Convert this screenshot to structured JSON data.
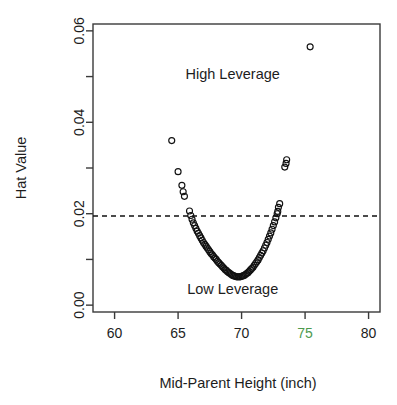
{
  "chart_data": {
    "type": "scatter",
    "title": "",
    "xlabel": "Mid-Parent Height (inch)",
    "ylabel": "Hat Value",
    "xlim": [
      58.3,
      80.9
    ],
    "ylim": [
      -0.0015,
      0.0615
    ],
    "grid": false,
    "legend": null,
    "xticks": [
      60,
      65,
      70,
      75,
      80
    ],
    "xtick_labels": [
      "60",
      "65",
      "70",
      "75",
      "80"
    ],
    "xtick_label_colors": [
      "#1d1d1d",
      "#1d1d1d",
      "#1d1d1d",
      "#4e9a4e",
      "#1d1d1d"
    ],
    "yticks": [
      0.0,
      0.01,
      0.02,
      0.03,
      0.04,
      0.05,
      0.06
    ],
    "ytick_labels": [
      "0.00",
      "",
      "0.02",
      "",
      "0.04",
      "",
      "0.06"
    ],
    "annotations": [
      {
        "text": "High Leverage",
        "x": 69.3,
        "y": 0.0495
      },
      {
        "text": "Low Leverage",
        "x": 69.3,
        "y": 0.0025
      }
    ],
    "threshold": {
      "label": "hat value cutoff",
      "y": 0.0195,
      "style": "dashed",
      "color": "#111111"
    },
    "marker": {
      "shape": "open-circle",
      "radius_px": 3.0,
      "color": "#111111"
    },
    "points": [
      [
        64.5,
        0.036
      ],
      [
        65.0,
        0.0292
      ],
      [
        65.3,
        0.0262
      ],
      [
        65.4,
        0.0248
      ],
      [
        65.5,
        0.0238
      ],
      [
        65.9,
        0.0206
      ],
      [
        66.0,
        0.0196
      ],
      [
        66.1,
        0.0188
      ],
      [
        66.2,
        0.018
      ],
      [
        66.3,
        0.0174
      ],
      [
        66.4,
        0.0168
      ],
      [
        66.5,
        0.0162
      ],
      [
        66.6,
        0.0157
      ],
      [
        66.7,
        0.0152
      ],
      [
        66.8,
        0.0147
      ],
      [
        66.9,
        0.0142
      ],
      [
        67.0,
        0.0137
      ],
      [
        67.1,
        0.0133
      ],
      [
        67.2,
        0.0129
      ],
      [
        67.3,
        0.0125
      ],
      [
        67.4,
        0.0121
      ],
      [
        67.5,
        0.0117
      ],
      [
        67.6,
        0.0113
      ],
      [
        67.7,
        0.011
      ],
      [
        67.8,
        0.0106
      ],
      [
        67.9,
        0.0103
      ],
      [
        68.0,
        0.01
      ],
      [
        68.1,
        0.0096
      ],
      [
        68.2,
        0.0093
      ],
      [
        68.3,
        0.009
      ],
      [
        68.4,
        0.0087
      ],
      [
        68.5,
        0.0084
      ],
      [
        68.6,
        0.0081
      ],
      [
        68.7,
        0.0078
      ],
      [
        68.8,
        0.0076
      ],
      [
        68.9,
        0.0073
      ],
      [
        69.0,
        0.0071
      ],
      [
        69.1,
        0.0069
      ],
      [
        69.2,
        0.0067
      ],
      [
        69.3,
        0.0065
      ],
      [
        69.4,
        0.0064
      ],
      [
        69.5,
        0.0063
      ],
      [
        69.6,
        0.0062
      ],
      [
        69.7,
        0.0062
      ],
      [
        69.8,
        0.0062
      ],
      [
        69.9,
        0.0062
      ],
      [
        70.0,
        0.0063
      ],
      [
        70.1,
        0.0064
      ],
      [
        70.2,
        0.0065
      ],
      [
        70.3,
        0.0067
      ],
      [
        70.4,
        0.0069
      ],
      [
        70.5,
        0.0071
      ],
      [
        70.6,
        0.0074
      ],
      [
        70.7,
        0.0077
      ],
      [
        70.8,
        0.008
      ],
      [
        70.9,
        0.0083
      ],
      [
        71.0,
        0.0087
      ],
      [
        71.1,
        0.0091
      ],
      [
        71.2,
        0.0095
      ],
      [
        71.3,
        0.0099
      ],
      [
        71.4,
        0.0104
      ],
      [
        71.5,
        0.0109
      ],
      [
        71.6,
        0.0114
      ],
      [
        71.7,
        0.0119
      ],
      [
        71.8,
        0.0125
      ],
      [
        71.9,
        0.0131
      ],
      [
        72.0,
        0.0137
      ],
      [
        72.1,
        0.0144
      ],
      [
        72.2,
        0.0151
      ],
      [
        72.3,
        0.0158
      ],
      [
        72.4,
        0.0166
      ],
      [
        72.5,
        0.0174
      ],
      [
        72.6,
        0.0182
      ],
      [
        72.7,
        0.0191
      ],
      [
        72.8,
        0.02
      ],
      [
        72.85,
        0.0205
      ],
      [
        72.9,
        0.0214
      ],
      [
        73.0,
        0.0222
      ],
      [
        73.4,
        0.0302
      ],
      [
        73.5,
        0.031
      ],
      [
        73.55,
        0.0318
      ],
      [
        75.4,
        0.0565
      ]
    ],
    "dense_cluster_note": "Points overlap heavily near the base of the U between 67 and 72 inches."
  },
  "axis": {
    "y_label": "Hat Value",
    "x_label": "Mid-Parent Height (inch)"
  },
  "annotations": {
    "high": "High Leverage",
    "low": "Low Leverage"
  },
  "colors": {
    "point": "#111111",
    "axis": "#3a3a3a",
    "text": "#1d1d1d",
    "highlight_tick": "#4e9a4e",
    "threshold": "#111111",
    "background": "#ffffff"
  }
}
